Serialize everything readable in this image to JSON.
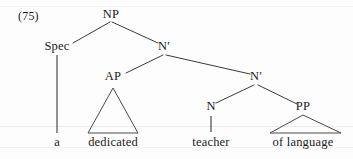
{
  "figure": {
    "example_number": "(75)",
    "type": "syntax-tree"
  },
  "nodes": {
    "np": {
      "label": "NP",
      "x": 111,
      "y": 8
    },
    "spec": {
      "label": "Spec",
      "x": 57,
      "y": 40
    },
    "nbar1": {
      "label": "N′",
      "x": 164,
      "y": 40
    },
    "ap": {
      "label": "AP",
      "x": 113,
      "y": 70
    },
    "nbar2": {
      "label": "N′",
      "x": 256,
      "y": 70
    },
    "n": {
      "label": "N",
      "x": 211,
      "y": 100
    },
    "pp": {
      "label": "PP",
      "x": 303,
      "y": 100
    }
  },
  "terminals": {
    "det": {
      "label": "a",
      "x": 57,
      "y": 136
    },
    "adjective": {
      "label": "dedicated",
      "x": 113,
      "y": 136
    },
    "noun": {
      "label": "teacher",
      "x": 211,
      "y": 136
    },
    "prep_phrase": {
      "label": "of language",
      "x": 303,
      "y": 136
    }
  },
  "colors": {
    "ink": "#1a1a1a",
    "line": "#3a3a3a",
    "page": "#fdfdfd"
  }
}
